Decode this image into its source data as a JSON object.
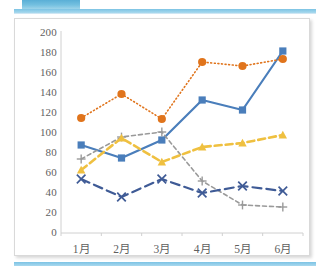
{
  "banner": {
    "block_color": "#74c0e0",
    "rule_color": "#a9d9ee"
  },
  "chart_data": {
    "type": "line",
    "title": "",
    "subtitle": "",
    "xlabel": "",
    "ylabel": "",
    "categories": [
      "1月",
      "2月",
      "3月",
      "4月",
      "5月",
      "6月"
    ],
    "ylim": [
      0,
      200
    ],
    "ytick_step": 20,
    "yticks": [
      "200",
      "180",
      "160",
      "140",
      "120",
      "100",
      "80",
      "60",
      "40",
      "20",
      "0"
    ],
    "grid": false,
    "legend": "none",
    "series": [
      {
        "name": "series-1",
        "values": [
          88,
          75,
          93,
          133,
          123,
          182
        ],
        "color": "#4a7ebb",
        "marker": "square",
        "dash": "solid",
        "width": 2.2
      },
      {
        "name": "series-2",
        "values": [
          115,
          139,
          114,
          171,
          167,
          174
        ],
        "color": "#e0741c",
        "marker": "circle",
        "dash": "dotted",
        "width": 1.6
      },
      {
        "name": "series-3",
        "values": [
          74,
          96,
          101,
          52,
          28,
          26
        ],
        "color": "#9a9a9a",
        "marker": "plus",
        "dash": "dashed",
        "width": 1.6
      },
      {
        "name": "series-4",
        "values": [
          63,
          95,
          71,
          86,
          90,
          98
        ],
        "color": "#efc040",
        "marker": "triangle",
        "dash": "dashed-wide",
        "width": 2.6
      },
      {
        "name": "series-5",
        "values": [
          54,
          36,
          54,
          40,
          47,
          42
        ],
        "color": "#3f5b96",
        "marker": "x",
        "dash": "long-dash",
        "width": 2.2
      }
    ]
  }
}
